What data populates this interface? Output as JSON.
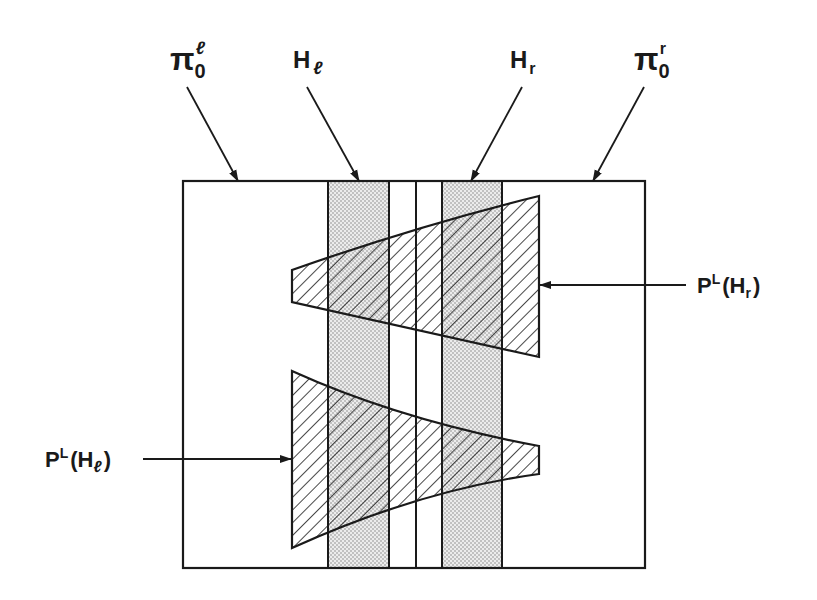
{
  "figure": {
    "labels": {
      "pi_left": {
        "base": "π",
        "sub": "0",
        "sup": "ℓ"
      },
      "h_left": {
        "base": "H",
        "sub": "ℓ"
      },
      "h_right": {
        "base": "H",
        "sub": "r"
      },
      "pi_right": {
        "base": "π",
        "sub": "0",
        "sup": "r"
      },
      "p_h_right": {
        "base": "P",
        "sup": "L",
        "open": "(H",
        "sub": "r",
        "close": ")"
      },
      "p_h_left": {
        "base": "P",
        "sup": "L",
        "open": "(H",
        "sub": "ℓ",
        "close": ")"
      }
    },
    "regions": {
      "box": {
        "x1": 183,
        "y1": 181,
        "x2": 645,
        "y2": 568
      },
      "h_left_band": {
        "x1": 328,
        "x2": 389
      },
      "center_line": {
        "x": 416
      },
      "h_right_band": {
        "x1": 442,
        "x2": 502
      },
      "upper_trapezoid": {
        "left_x": 292,
        "left_top": 270,
        "left_bottom": 302,
        "right_x": 539,
        "right_top": 196,
        "right_bottom": 357
      },
      "lower_trapezoid": {
        "left_x": 292,
        "left_top": 371,
        "left_bottom": 548,
        "right_x": 539,
        "right_top": 446,
        "right_bottom": 474
      }
    },
    "colors": {
      "ink": "#1a1a1a",
      "stipple": "#bdbdbd",
      "background": "#ffffff"
    }
  }
}
